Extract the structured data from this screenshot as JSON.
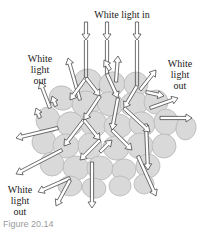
{
  "labels": {
    "light_in": "White light in",
    "light_out_left": "White\nlight\nout",
    "light_out_right": "White\nlight\nout",
    "light_out_bottom": "White\nlight\nout"
  },
  "caption": "Figure 20.14",
  "colors": {
    "particle_fill": "#d9d9d9",
    "particle_stroke": "#b8b8b8",
    "arrow_fill": "#ffffff",
    "arrow_stroke": "#333333"
  }
}
